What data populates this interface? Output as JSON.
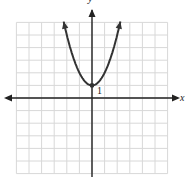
{
  "chart_data": {
    "type": "line",
    "title": "",
    "xlabel": "x",
    "ylabel": "y",
    "function": "y = x^2 + 1",
    "xlim": [
      -6,
      6
    ],
    "ylim": [
      -6,
      6
    ],
    "grid": true,
    "grid_step": 1,
    "series": [
      {
        "name": "parabola",
        "x": [
          -2.25,
          -2,
          -1.5,
          -1,
          -0.5,
          0,
          0.5,
          1,
          1.5,
          2,
          2.25
        ],
        "values": [
          6.06,
          5,
          3.25,
          2,
          1.25,
          1,
          1.25,
          2,
          3.25,
          5,
          6.06
        ]
      }
    ],
    "annotations": [
      {
        "text": "1",
        "x": 0,
        "y": 1,
        "note": "vertex / y-intercept"
      }
    ]
  },
  "labels": {
    "x_axis": "x",
    "y_axis": "y",
    "vertex_label": "1"
  },
  "colors": {
    "grid": "#d8d8d8",
    "axis": "#222222",
    "curve": "#333333"
  }
}
